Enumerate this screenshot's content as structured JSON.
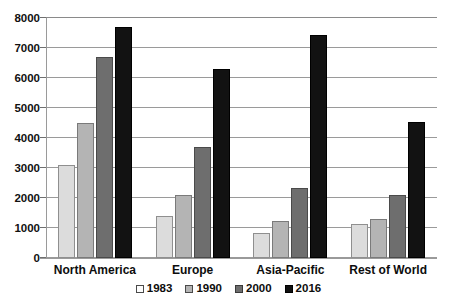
{
  "chart_data": {
    "type": "bar",
    "title": "",
    "subtitle": "",
    "xlabel": "",
    "ylabel": "",
    "categories": [
      "North America",
      "Europe",
      "Asia-Pacific",
      "Rest of World"
    ],
    "series": [
      {
        "name": "1983",
        "color": "#dcdcdc",
        "values": [
          3100,
          1400,
          850,
          1150
        ]
      },
      {
        "name": "1990",
        "color": "#b4b4b4",
        "values": [
          4500,
          2100,
          1250,
          1300
        ]
      },
      {
        "name": "2000",
        "color": "#6e6e6e",
        "values": [
          6700,
          3700,
          2350,
          2100
        ]
      },
      {
        "name": "2016",
        "color": "#121212",
        "values": [
          7700,
          6300,
          7450,
          4550
        ]
      }
    ],
    "ylim": [
      0,
      8000
    ],
    "ytick_step": 1000,
    "yticks": [
      "8000",
      "7000",
      "6000",
      "5000",
      "4000",
      "3000",
      "2000",
      "1000",
      "0"
    ],
    "ytick_values": [
      8000,
      7000,
      6000,
      5000,
      4000,
      3000,
      2000,
      1000,
      0
    ],
    "grid": true,
    "grid_axis": "y",
    "legend_position": "bottom",
    "bar_mode": "grouped"
  },
  "colors": {
    "background": "#ffffff",
    "gridline": "#9a9a9a",
    "axis": "#9a9a9a",
    "text": "#0d0d0d"
  }
}
